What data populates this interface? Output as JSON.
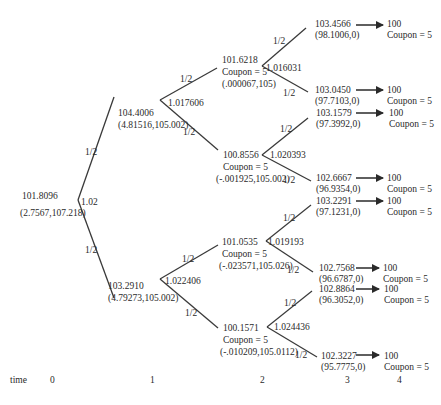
{
  "diagram": {
    "time_axis": {
      "label": "time",
      "ticks": [
        "0",
        "1",
        "2",
        "3",
        "4"
      ]
    },
    "nodes": {
      "t0": {
        "price": "101.8096",
        "pair": "(2.7567,107.218)",
        "rate": "1.02"
      },
      "t1_up": {
        "price": "104.4006",
        "pair": "(4.81516,105.002)",
        "rate": "1.017606"
      },
      "t1_down": {
        "price": "103.2910",
        "pair": "(4.79273,105.002)",
        "rate": "1.022406"
      },
      "t2_uu": {
        "price": "101.6218",
        "coupon": "Coupon = 5",
        "pair": "(.000067,105)",
        "rate": "1.016031"
      },
      "t2_ud": {
        "price": "100.8556",
        "coupon": "Coupon = 5",
        "pair": "(-.001925,105.002)",
        "rate": "1.020393"
      },
      "t2_du": {
        "price": "101.0535",
        "coupon": "Coupon = 5",
        "pair": "(-.023571,105.026)",
        "rate": "1.019193"
      },
      "t2_dd": {
        "price": "100.1571",
        "coupon": "Coupon = 5",
        "pair": "(-.010209,105.0112)",
        "rate": "1.024436"
      },
      "t3": [
        {
          "price": "103.4566",
          "pair": "(98.1006,0)"
        },
        {
          "price": "103.0450",
          "pair": "(97.7103,0)"
        },
        {
          "price": "103.1579",
          "pair": "(97.3992,0)"
        },
        {
          "price": "102.6667",
          "pair": "(96.9354,0)"
        },
        {
          "price": "103.2291",
          "pair": "(97.1231,0)"
        },
        {
          "price": "102.7568",
          "pair": "(96.6787,0)"
        },
        {
          "price": "102.8864",
          "pair": "(96.3052,0)"
        },
        {
          "price": "102.3227",
          "pair": "(95.7775,0)"
        }
      ],
      "t4": [
        {
          "face": "100",
          "coupon": "Coupon = 5"
        },
        {
          "face": "100",
          "coupon": "Coupon = 5"
        },
        {
          "face": "100",
          "coupon": "Coupon = 5"
        },
        {
          "face": "100",
          "coupon": "Coupon = 5"
        },
        {
          "face": "100",
          "coupon": "Coupon = 5"
        },
        {
          "face": "100",
          "coupon": "Coupon = 5"
        },
        {
          "face": "100",
          "coupon": "Coupon = 5"
        },
        {
          "face": "100",
          "coupon": "Coupon = 5"
        }
      ]
    },
    "probability_label": "1/2",
    "colors": {
      "line": "#3a3a3a",
      "text": "#2a2a2a",
      "background": "#ffffff"
    }
  }
}
